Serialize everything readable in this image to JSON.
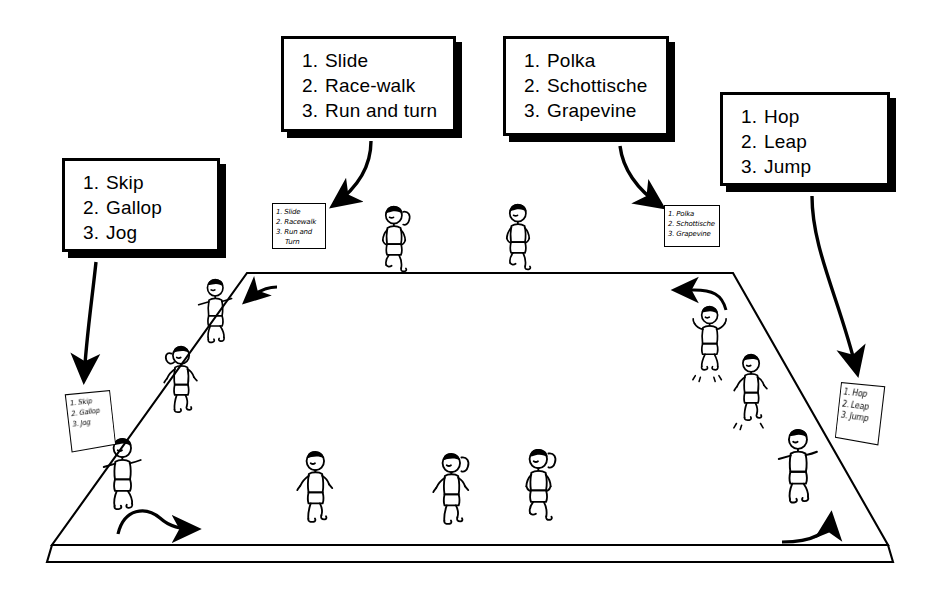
{
  "diagram": {
    "ink_color": "#000000",
    "background_color": "#ffffff"
  },
  "callouts": [
    {
      "name": "callout-skip-gallop-jog",
      "items": [
        {
          "num": "1.",
          "label": "Skip"
        },
        {
          "num": "2.",
          "label": "Gallop"
        },
        {
          "num": "3.",
          "label": "Jog"
        }
      ]
    },
    {
      "name": "callout-slide-racewalk-runturn",
      "items": [
        {
          "num": "1.",
          "label": "Slide"
        },
        {
          "num": "2.",
          "label": "Race-walk"
        },
        {
          "num": "3.",
          "label": "Run and turn"
        }
      ]
    },
    {
      "name": "callout-polka-schottische-grapevine",
      "items": [
        {
          "num": "1.",
          "label": "Polka"
        },
        {
          "num": "2.",
          "label": "Schottische"
        },
        {
          "num": "3.",
          "label": "Grapevine"
        }
      ]
    },
    {
      "name": "callout-hop-leap-jump",
      "items": [
        {
          "num": "1.",
          "label": "Hop"
        },
        {
          "num": "2.",
          "label": "Leap"
        },
        {
          "num": "3.",
          "label": "Jump"
        }
      ]
    }
  ],
  "signs": [
    {
      "name": "station-sign-left",
      "lines": [
        "1. Skip",
        "2. Gallop",
        "3. Jog"
      ]
    },
    {
      "name": "station-sign-back-left",
      "lines": [
        "1. Slide",
        "2. Racewalk",
        "3. Run and",
        "Turn"
      ]
    },
    {
      "name": "station-sign-back-right",
      "lines": [
        "1. Polka",
        "2. Schottische",
        "3. Grapevine"
      ]
    },
    {
      "name": "station-sign-right",
      "lines": [
        "1. Hop",
        "2. Leap",
        "3. Jump"
      ]
    }
  ],
  "floor": {
    "name": "gym-floor-platform",
    "shape": "trapezoid-perspective",
    "back_left": [
      247,
      273
    ],
    "back_right": [
      733,
      273
    ],
    "front_left": [
      52,
      545
    ],
    "front_right": [
      888,
      545
    ],
    "edge_thickness": 16
  },
  "flow_arrows": [
    {
      "name": "flow-arrow-front-rightward",
      "direction": "right"
    },
    {
      "name": "flow-arrow-back-left-inward",
      "direction": "down-left"
    },
    {
      "name": "flow-arrow-back-rightward",
      "direction": "left"
    },
    {
      "name": "flow-arrow-right-upward",
      "direction": "up"
    }
  ],
  "connectors": [
    {
      "name": "connector-callout1-to-sign-left",
      "from": "callout-skip-gallop-jog",
      "to": "station-sign-left"
    },
    {
      "name": "connector-callout2-to-sign-back-left",
      "from": "callout-slide-racewalk-runturn",
      "to": "station-sign-back-left"
    },
    {
      "name": "connector-callout3-to-sign-back-right",
      "from": "callout-polka-schottische-grapevine",
      "to": "station-sign-back-right"
    },
    {
      "name": "connector-callout4-to-sign-right",
      "from": "callout-hop-leap-jump",
      "to": "station-sign-right"
    }
  ],
  "figures": [
    {
      "name": "figure-left-upper-skipping",
      "pose": "skip"
    },
    {
      "name": "figure-left-middle-galloping",
      "pose": "gallop"
    },
    {
      "name": "figure-left-lower-jogging",
      "pose": "jog"
    },
    {
      "name": "figure-back-left-racewalking",
      "pose": "race-walk"
    },
    {
      "name": "figure-back-right-running",
      "pose": "run-and-turn"
    },
    {
      "name": "figure-right-upper-hopping",
      "pose": "hop"
    },
    {
      "name": "figure-right-middle-leaping",
      "pose": "leap"
    },
    {
      "name": "figure-right-lower-jumping",
      "pose": "jump"
    },
    {
      "name": "figure-center-jogging",
      "pose": "jog"
    },
    {
      "name": "figure-center-polka",
      "pose": "polka"
    },
    {
      "name": "figure-center-grapevine",
      "pose": "grapevine"
    }
  ]
}
